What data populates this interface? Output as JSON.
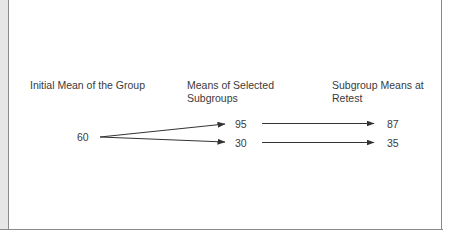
{
  "diagram": {
    "columns": [
      {
        "id": "initial",
        "label": "Initial Mean of the Group"
      },
      {
        "id": "selected",
        "label": "Means of Selected Subgroups"
      },
      {
        "id": "retest",
        "label": "Subgroup Means at Retest"
      }
    ],
    "initial_value": "60",
    "selected_values": [
      "95",
      "30"
    ],
    "retest_values": [
      "87",
      "35"
    ],
    "arrows": [
      {
        "from": "60",
        "to": "95"
      },
      {
        "from": "60",
        "to": "30"
      },
      {
        "from": "95",
        "to": "87"
      },
      {
        "from": "30",
        "to": "35"
      }
    ],
    "colors": {
      "text": "#3a3a3a",
      "arrow": "#333333",
      "border": "#8a8a8a",
      "strip": "#e6e6e6"
    }
  }
}
